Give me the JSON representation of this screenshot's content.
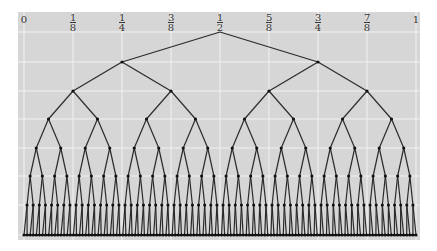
{
  "diagram": {
    "panel": {
      "x": 18,
      "y": 12,
      "w": 402,
      "h": 228,
      "bg": "#d6d6d6",
      "grid": "#f2f2f2"
    },
    "x_range": [
      24,
      416
    ],
    "levels_y": [
      32,
      62,
      91,
      119,
      148,
      176,
      205,
      235
    ],
    "depth": 7,
    "edge_color": "#2a2a2a",
    "node_color": "#111111",
    "axis_labels": [
      {
        "pos": 0,
        "text": "0"
      },
      {
        "pos": 0.125,
        "num": "1",
        "den": "8"
      },
      {
        "pos": 0.25,
        "num": "1",
        "den": "4"
      },
      {
        "pos": 0.375,
        "num": "3",
        "den": "8"
      },
      {
        "pos": 0.5,
        "num": "1",
        "den": "2"
      },
      {
        "pos": 0.625,
        "num": "5",
        "den": "8"
      },
      {
        "pos": 0.75,
        "num": "3",
        "den": "4"
      },
      {
        "pos": 0.875,
        "num": "7",
        "den": "8"
      },
      {
        "pos": 1,
        "text": "1"
      }
    ]
  }
}
